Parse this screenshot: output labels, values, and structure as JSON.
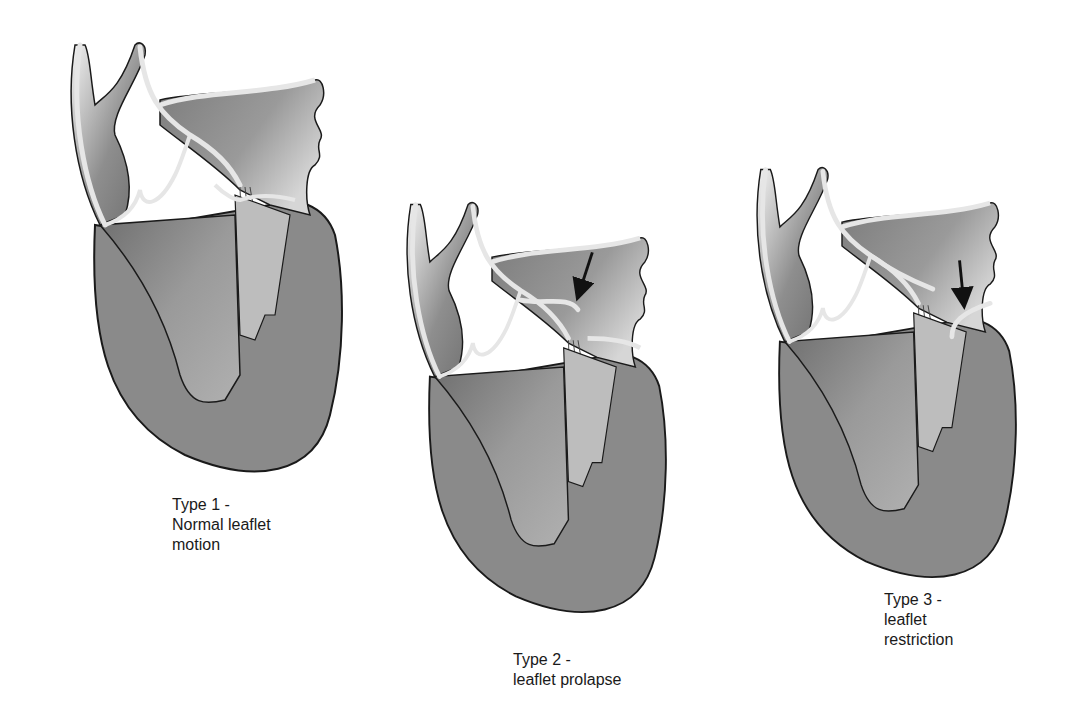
{
  "figure": {
    "panels": [
      {
        "id": "type1",
        "title": "Type 1 -",
        "lines": [
          "Type 1 -",
          "Normal leaflet",
          "motion"
        ],
        "arrow": false
      },
      {
        "id": "type2",
        "title": "Type 2 -",
        "lines": [
          "Type 2 -",
          "leaflet prolapse"
        ],
        "arrow": true
      },
      {
        "id": "type3",
        "title": "Type 3 -",
        "lines": [
          "Type 3 -",
          "leaflet restriction"
        ],
        "arrow": true
      }
    ],
    "colors": {
      "background": "#ffffff",
      "ventricle": "#8a8a8a",
      "chamber_dark": "#7a7a7a",
      "chamber_light": "#bdbdbd",
      "wall_highlight": "#e6e6e6",
      "outline": "#1a1a1a",
      "arrow": "#111111"
    }
  }
}
